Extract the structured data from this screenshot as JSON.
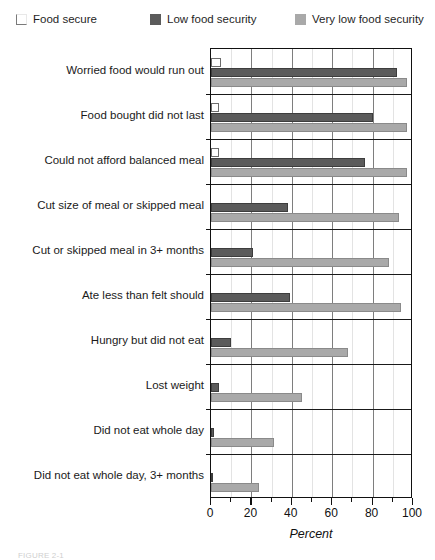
{
  "legend": {
    "items": [
      {
        "label": "Food secure",
        "swatch": "white-square-icon",
        "color": "#ffffff"
      },
      {
        "label": "Low food security",
        "swatch": "dark-square-icon",
        "color": "#5b5b5b"
      },
      {
        "label": "Very low food security",
        "swatch": "light-square-icon",
        "color": "#a9a9a9"
      }
    ]
  },
  "axis": {
    "x_label": "Percent",
    "x_ticks": [
      0,
      20,
      40,
      60,
      80,
      100
    ],
    "x_minor_ticks": [
      10,
      30,
      50,
      70,
      90
    ]
  },
  "caption": "FIGURE 2-1",
  "chart_data": {
    "type": "bar",
    "title": "",
    "subtitle": "",
    "orientation": "horizontal",
    "xlabel": "Percent",
    "ylabel": "",
    "xlim": [
      0,
      100
    ],
    "grid": true,
    "legend_position": "top",
    "categories": [
      "Worried food would run out",
      "Food bought did not last",
      "Could not afford balanced meal",
      "Cut size of meal or skipped meal",
      "Cut or skipped meal in 3+ months",
      "Ate less than felt should",
      "Hungry but did not eat",
      "Lost weight",
      "Did not eat whole day",
      "Did not eat whole day, 3+ months"
    ],
    "series": [
      {
        "name": "Food secure",
        "color": "#ffffff",
        "values": [
          5,
          4,
          4,
          0,
          0,
          0,
          0,
          0,
          0,
          0
        ]
      },
      {
        "name": "Low food security",
        "color": "#5b5b5b",
        "values": [
          92,
          80,
          76,
          38,
          21,
          39,
          10,
          4,
          1.5,
          0.5
        ]
      },
      {
        "name": "Very low food security",
        "color": "#a9a9a9",
        "values": [
          97,
          97,
          97,
          93,
          88,
          94,
          68,
          45,
          31,
          24
        ]
      }
    ]
  }
}
